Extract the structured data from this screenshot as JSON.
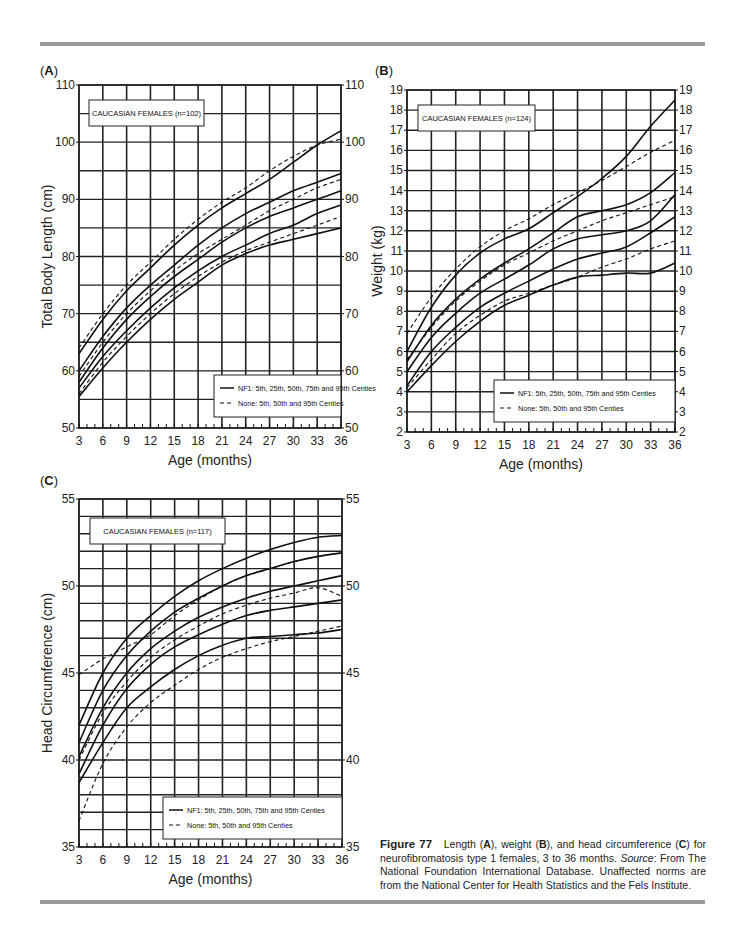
{
  "page": {
    "panel_labels": [
      "A",
      "B",
      "C"
    ],
    "caption": {
      "figure": "Figure 77",
      "text1": "Length (",
      "A": "A",
      "text2": "), weight (",
      "B": "B",
      "text3": "), and head circumference (",
      "C": "C",
      "text4": ") for neurofibromatosis type 1 females, 3 to 36 months. ",
      "source_label": "Source",
      "text5": ": From The National Foundation International Database. Unaffected norms are from the National Center for Health Statistics and the Fels Institute."
    }
  },
  "chart_data": [
    {
      "id": "A",
      "type": "line",
      "title": "CAUCASIAN FEMALES (n=102)",
      "xlabel": "Age (months)",
      "ylabel": "Total Body Length (cm)",
      "x": [
        3,
        6,
        9,
        12,
        15,
        18,
        21,
        24,
        27,
        30,
        33,
        36
      ],
      "xticks": [
        3,
        6,
        9,
        12,
        15,
        18,
        21,
        24,
        27,
        30,
        33,
        36
      ],
      "yticks": [
        50,
        60,
        70,
        80,
        90,
        100,
        110
      ],
      "ylim": [
        50,
        110
      ],
      "grid": true,
      "legend": [
        "NF1: 5th, 25th, 50th, 75th and 95th Centies",
        "None: 5th, 50th and 95th Centies"
      ],
      "legend_position": "lower right",
      "series": [
        {
          "name": "NF1 95th",
          "style": "solid",
          "values": [
            63,
            69,
            74,
            78,
            82,
            85.5,
            88.5,
            91,
            93.5,
            96.5,
            99.5,
            102
          ]
        },
        {
          "name": "NF1 75th",
          "style": "solid",
          "values": [
            60,
            66,
            71,
            75,
            78.5,
            82,
            85,
            87.5,
            89.5,
            91.5,
            93,
            94.5
          ]
        },
        {
          "name": "NF1 50th",
          "style": "solid",
          "values": [
            58,
            64,
            69,
            73,
            76.5,
            79.5,
            82.5,
            85,
            87,
            88.5,
            90,
            91.5
          ]
        },
        {
          "name": "NF1 25th",
          "style": "solid",
          "values": [
            57,
            62.5,
            67,
            71,
            74.5,
            77.5,
            80,
            82,
            84,
            85.5,
            87.5,
            89
          ]
        },
        {
          "name": "NF1 5th",
          "style": "solid",
          "values": [
            55.5,
            60.5,
            65,
            69,
            72.5,
            75.5,
            78.5,
            80.5,
            82,
            83,
            84,
            85
          ]
        },
        {
          "name": "None 95th",
          "style": "dashed",
          "values": [
            64,
            70,
            75,
            79,
            83,
            86.5,
            89.5,
            92,
            95,
            97.5,
            99.5,
            100.5
          ]
        },
        {
          "name": "None 50th",
          "style": "dashed",
          "values": [
            59,
            65,
            70,
            74,
            77.5,
            80.5,
            83,
            85.5,
            88,
            90,
            92,
            93.5
          ]
        },
        {
          "name": "None 5th",
          "style": "dashed",
          "values": [
            56,
            61.5,
            66,
            70,
            73.5,
            76.5,
            79,
            81,
            82.5,
            84,
            85.5,
            87
          ]
        }
      ]
    },
    {
      "id": "B",
      "type": "line",
      "title": "CAUCASIAN FEMALES (n=124)",
      "xlabel": "Age (months)",
      "ylabel": "Weight (kg)",
      "x": [
        3,
        6,
        9,
        12,
        15,
        18,
        21,
        24,
        27,
        30,
        33,
        36
      ],
      "xticks": [
        3,
        6,
        9,
        12,
        15,
        18,
        21,
        24,
        27,
        30,
        33,
        36
      ],
      "yticks": [
        2,
        3,
        4,
        5,
        6,
        7,
        8,
        9,
        10,
        11,
        12,
        13,
        14,
        15,
        16,
        17,
        18,
        19
      ],
      "ylim": [
        2,
        19
      ],
      "grid": true,
      "legend": [
        "NF1: 5th, 25th, 50th, 75th and 95th Centies",
        "None: 5th, 50th and 95th Centies"
      ],
      "legend_position": "lower right",
      "series": [
        {
          "name": "NF1 95th",
          "style": "solid",
          "values": [
            6,
            8.2,
            9.8,
            10.9,
            11.6,
            12.1,
            12.9,
            13.7,
            14.6,
            15.7,
            17.2,
            18.5
          ]
        },
        {
          "name": "NF1 75th",
          "style": "solid",
          "values": [
            5.5,
            7.3,
            8.6,
            9.6,
            10.4,
            11.1,
            11.9,
            12.7,
            13.0,
            13.3,
            13.9,
            14.9
          ]
        },
        {
          "name": "NF1 50th",
          "style": "solid",
          "values": [
            5,
            6.7,
            7.9,
            8.9,
            9.6,
            10.3,
            11.1,
            11.6,
            11.8,
            12.0,
            12.5,
            13.8
          ]
        },
        {
          "name": "NF1 25th",
          "style": "solid",
          "values": [
            4.3,
            6.0,
            7.2,
            8.2,
            8.9,
            9.5,
            10.1,
            10.6,
            10.9,
            11.2,
            11.9,
            12.7
          ]
        },
        {
          "name": "NF1 5th",
          "style": "solid",
          "values": [
            4.0,
            5.3,
            6.5,
            7.5,
            8.3,
            8.8,
            9.3,
            9.7,
            9.8,
            9.9,
            9.9,
            10.4
          ]
        },
        {
          "name": "None 95th",
          "style": "dashed",
          "values": [
            6.9,
            8.7,
            10.1,
            11.2,
            12.0,
            12.6,
            13.3,
            13.9,
            14.5,
            15.2,
            15.9,
            16.5
          ]
        },
        {
          "name": "None 50th",
          "style": "dashed",
          "values": [
            5.6,
            7.2,
            8.5,
            9.5,
            10.3,
            10.9,
            11.5,
            12.0,
            12.5,
            12.9,
            13.3,
            13.7
          ]
        },
        {
          "name": "None 5th",
          "style": "dashed",
          "values": [
            4.2,
            5.6,
            6.9,
            7.8,
            8.5,
            8.9,
            9.3,
            9.7,
            10.2,
            10.6,
            11.1,
            11.5
          ]
        }
      ]
    },
    {
      "id": "C",
      "type": "line",
      "title": "CAUCASIAN FEMALES (n=117)",
      "xlabel": "Age (months)",
      "ylabel": "Head Circumference (cm)",
      "x": [
        3,
        6,
        9,
        12,
        15,
        18,
        21,
        24,
        27,
        30,
        33,
        36
      ],
      "xticks": [
        3,
        6,
        9,
        12,
        15,
        18,
        21,
        24,
        27,
        30,
        33,
        36
      ],
      "yticks": [
        35,
        40,
        45,
        50,
        55
      ],
      "ylim": [
        35,
        55
      ],
      "grid": true,
      "legend": [
        "NF1: 5th, 25th, 50th, 75th and 95th Centies",
        "None: 5th, 50th and 95th Centies"
      ],
      "legend_position": "lower right",
      "series": [
        {
          "name": "NF1 95th",
          "style": "solid",
          "values": [
            42,
            45,
            47,
            48.3,
            49.4,
            50.3,
            51,
            51.6,
            52.1,
            52.5,
            52.8,
            52.9
          ]
        },
        {
          "name": "NF1 75th",
          "style": "solid",
          "values": [
            41,
            44,
            46,
            47.4,
            48.5,
            49.3,
            50,
            50.6,
            51,
            51.4,
            51.7,
            51.9
          ]
        },
        {
          "name": "NF1 50th",
          "style": "solid",
          "values": [
            40.2,
            43,
            45,
            46.4,
            47.4,
            48.2,
            48.8,
            49.3,
            49.7,
            50,
            50.3,
            50.6
          ]
        },
        {
          "name": "NF1 25th",
          "style": "solid",
          "values": [
            39.2,
            42,
            44.1,
            45.5,
            46.5,
            47.2,
            47.8,
            48.3,
            48.6,
            48.8,
            49,
            49.2
          ]
        },
        {
          "name": "NF1 5th",
          "style": "solid",
          "values": [
            38.7,
            41,
            43,
            44.2,
            45.2,
            46,
            46.6,
            47,
            47.1,
            47.2,
            47.3,
            47.5
          ]
        },
        {
          "name": "None 95th",
          "style": "dashed",
          "values": [
            44.9,
            45.8,
            46.5,
            47.2,
            48.3,
            49.2,
            50,
            50.6,
            51,
            51.4,
            51.7,
            51.9
          ]
        },
        {
          "name": "None 50th",
          "style": "dashed",
          "values": [
            40,
            42.7,
            44.5,
            45.9,
            46.9,
            47.7,
            48.4,
            48.9,
            49.3,
            49.6,
            49.9,
            49.4
          ]
        },
        {
          "name": "None 5th",
          "style": "dashed",
          "values": [
            36.5,
            39.8,
            41.9,
            43.3,
            44.3,
            45.2,
            45.9,
            46.4,
            46.8,
            47.1,
            47.4,
            47.7
          ]
        }
      ]
    }
  ]
}
